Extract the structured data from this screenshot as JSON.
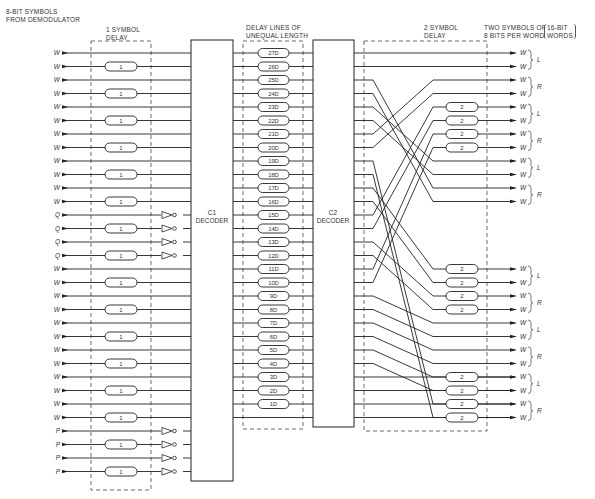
{
  "labels": {
    "input_header_1": "8-BIT SYMBOLS",
    "input_header_2": "FROM DEMODULATOR",
    "delay1_header_1": "1 SYMBOL",
    "delay1_header_2": "DELAY",
    "delaylines_header_1": "DELAY LINES OF",
    "delaylines_header_2": "UNEQUAL LENGTH",
    "delay2_header_1": "2 SYMBOL",
    "delay2_header_2": "DELAY",
    "output_header_1": "TWO SYMBOLS OF",
    "output_header_2": "8 BITS PER WORD",
    "output_bracket_1": "16-BIT",
    "output_bracket_2": "WORDS",
    "c1_line1": "C1",
    "c1_line2": "DECODER",
    "c2_line1": "C2",
    "c2_line2": "DECODER"
  },
  "inputs": [
    "W",
    "W",
    "W",
    "W",
    "W",
    "W",
    "W",
    "W",
    "W",
    "W",
    "W",
    "W",
    "Q",
    "Q",
    "Q",
    "Q",
    "W",
    "W",
    "W",
    "W",
    "W",
    "W",
    "W",
    "W",
    "W",
    "W",
    "W",
    "W",
    "P",
    "P",
    "P",
    "P"
  ],
  "one_symbol_delay_label": "1",
  "one_symbol_delay_rows": [
    1,
    3,
    5,
    7,
    9,
    11,
    13,
    15,
    17,
    19,
    21,
    23,
    25,
    27,
    29,
    31
  ],
  "inverter_rows": [
    12,
    13,
    14,
    15,
    28,
    29,
    30,
    31
  ],
  "delay_lines": [
    "27D",
    "26D",
    "25D",
    "24D",
    "23D",
    "22D",
    "21D",
    "20D",
    "19D",
    "18D",
    "17D",
    "16D",
    "15D",
    "14D",
    "13D",
    "12D",
    "11D",
    "10D",
    "9D",
    "8D",
    "7D",
    "6D",
    "5D",
    "4D",
    "3D",
    "2D",
    "1D"
  ],
  "two_symbol_delay_label": "2",
  "two_symbol_delay_outputs": [
    4,
    5,
    6,
    7,
    12,
    13,
    14,
    15,
    20,
    21,
    22,
    23
  ],
  "outputs": [
    "W",
    "W",
    "W",
    "W",
    "W",
    "W",
    "W",
    "W",
    "W",
    "W",
    "W",
    "W",
    "W",
    "W",
    "W",
    "W",
    "W",
    "W",
    "W",
    "W",
    "W",
    "W",
    "W",
    "W"
  ],
  "output_groups": [
    "L",
    "R",
    "L",
    "R",
    "L",
    "R",
    "L",
    "R",
    "L",
    "R",
    "L",
    "R"
  ]
}
